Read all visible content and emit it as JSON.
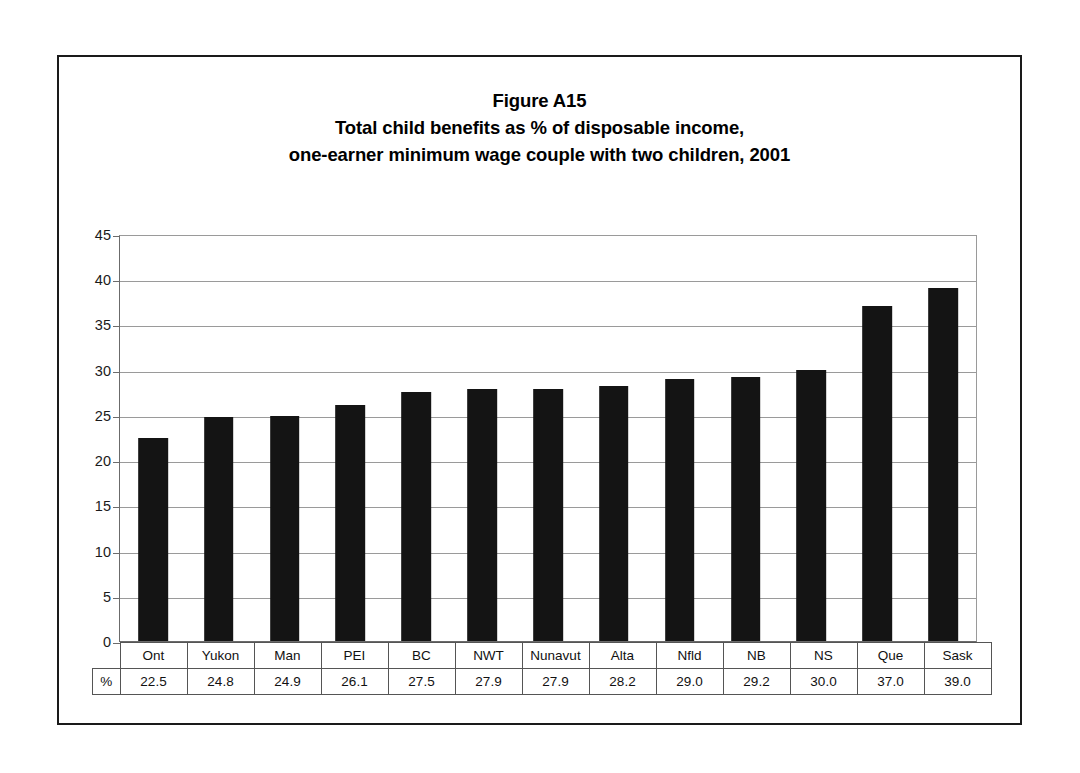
{
  "figure": {
    "title_lines": [
      "Figure A15",
      "Total child benefits as % of disposable income,",
      "one-earner minimum wage couple with two children, 2001"
    ],
    "unit_label": "%"
  },
  "chart_data": {
    "type": "bar",
    "xlabel": "",
    "ylabel": "",
    "ylim": [
      0,
      45
    ],
    "yticks": [
      0,
      5,
      10,
      15,
      20,
      25,
      30,
      35,
      40,
      45
    ],
    "ytick_labels": [
      "0",
      "5",
      "10",
      "15",
      "20",
      "25",
      "30",
      "35",
      "40",
      "45"
    ],
    "grid": true,
    "legend": "none",
    "bar_color": "#141414",
    "categories": [
      "Ont",
      "Yukon",
      "Man",
      "PEI",
      "BC",
      "NWT",
      "Nunavut",
      "Alta",
      "Nfld",
      "NB",
      "NS",
      "Que",
      "Sask"
    ],
    "values": [
      22.5,
      24.8,
      24.9,
      26.1,
      27.5,
      27.9,
      27.9,
      28.2,
      29.0,
      29.2,
      30.0,
      37.0,
      39.0
    ],
    "value_labels": [
      "22.5",
      "24.8",
      "24.9",
      "26.1",
      "27.5",
      "27.9",
      "27.9",
      "28.2",
      "29.0",
      "29.2",
      "30.0",
      "37.0",
      "39.0"
    ]
  }
}
